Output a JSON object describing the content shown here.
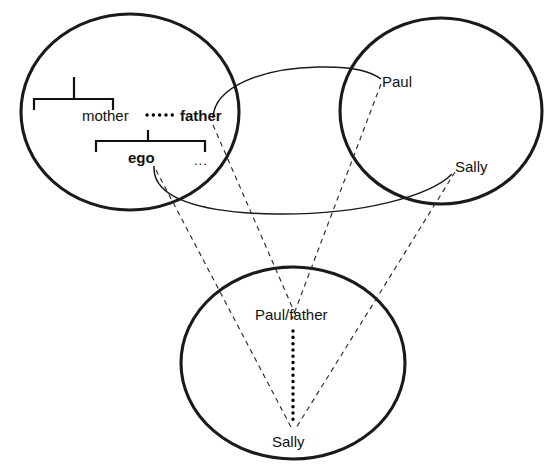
{
  "diagram": {
    "type": "conceptual-blend-network",
    "accent_color": "#1a1a1a",
    "background_color": "#ffffff"
  },
  "spaces": {
    "kinship": {
      "name": "kinship-input-space",
      "nodes": {
        "mother": "mother",
        "father": "father",
        "ego": "ego",
        "sibling_ellipsis": "..."
      },
      "relations": {
        "marriage": "mother-father marriage (dotted)",
        "parent_bracket": "parents of mother",
        "child_bracket": "children of mother and father"
      }
    },
    "names": {
      "name": "personal-name-input-space",
      "nodes": {
        "paul": "Paul",
        "sally": "Sally"
      }
    },
    "blend": {
      "name": "blended-space",
      "nodes": {
        "paul_father": "Paul/father",
        "sally": "Sally"
      },
      "relations": {
        "marriage": "Paul/father-Sally link (dotted)"
      }
    }
  },
  "cross_space_links": [
    {
      "from": "father",
      "to": "Paul",
      "style": "solid-curve"
    },
    {
      "from": "ego",
      "to": "Sally",
      "style": "solid-curve"
    }
  ],
  "projections": [
    {
      "from": "father",
      "to": "Paul/father",
      "style": "dashed"
    },
    {
      "from": "Paul",
      "to": "Paul/father",
      "style": "dashed"
    },
    {
      "from": "ego",
      "to": "Sally",
      "style": "dashed"
    },
    {
      "from": "Sally",
      "to": "Sally",
      "style": "dashed"
    }
  ]
}
